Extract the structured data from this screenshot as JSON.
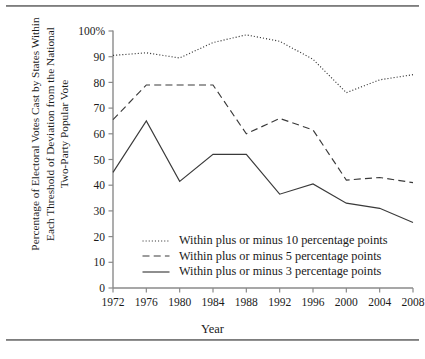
{
  "figure": {
    "ylabel_lines": [
      "Percentage of Electoral Votes Cast by States Within",
      "Each Threshold of Deviation from the National",
      "Two-Party Popular Vote"
    ],
    "xlabel": "Year"
  },
  "legend": {
    "items": [
      {
        "label": "Within plus or minus 10 percentage points",
        "style": "dotted",
        "swatch_name": "legend-swatch-dotted"
      },
      {
        "label": "Within plus or minus 5 percentage points",
        "style": "dashed",
        "swatch_name": "legend-swatch-dashed"
      },
      {
        "label": "Within plus or minus 3 percentage points",
        "style": "solid",
        "swatch_name": "legend-swatch-solid"
      }
    ]
  },
  "axes": {
    "y_ticks": [
      "100%",
      "90",
      "80",
      "70",
      "60",
      "50",
      "40",
      "30",
      "20",
      "10",
      "0"
    ],
    "x_ticks": [
      "1972",
      "1976",
      "1980",
      "1984",
      "1988",
      "1992",
      "1996",
      "2000",
      "2004",
      "2008"
    ]
  },
  "chart_data": {
    "type": "line",
    "title": "",
    "xlabel": "Year",
    "ylabel": "Percentage of Electoral Votes Cast by States Within Each Threshold of Deviation from the National Two-Party Popular Vote",
    "categories": [
      1972,
      1976,
      1980,
      1984,
      1988,
      1992,
      1996,
      2000,
      2004,
      2008
    ],
    "x": [
      1972,
      1976,
      1980,
      1984,
      1988,
      1992,
      1996,
      2000,
      2004,
      2008
    ],
    "series": [
      {
        "name": "Within plus or minus 10 percentage points",
        "style": "dotted",
        "values": [
          90.5,
          91.5,
          89.5,
          95.5,
          98.5,
          96.0,
          89.0,
          76.0,
          81.0,
          83.0
        ]
      },
      {
        "name": "Within plus or minus 5 percentage points",
        "style": "dashed",
        "values": [
          65.5,
          79.0,
          79.0,
          79.0,
          60.0,
          66.0,
          61.5,
          42.0,
          43.0,
          41.0
        ]
      },
      {
        "name": "Within plus or minus 3 percentage points",
        "style": "solid",
        "values": [
          45.0,
          65.0,
          41.5,
          52.0,
          52.0,
          36.5,
          40.5,
          33.0,
          31.0,
          25.5
        ]
      }
    ],
    "xlim": [
      1972,
      2008
    ],
    "ylim": [
      0,
      100
    ],
    "ytick_values": [
      0,
      10,
      20,
      30,
      40,
      50,
      60,
      70,
      80,
      90,
      100
    ],
    "grid": false,
    "legend_position": "inside-lower-center",
    "line_color": "#3a3a3a"
  }
}
